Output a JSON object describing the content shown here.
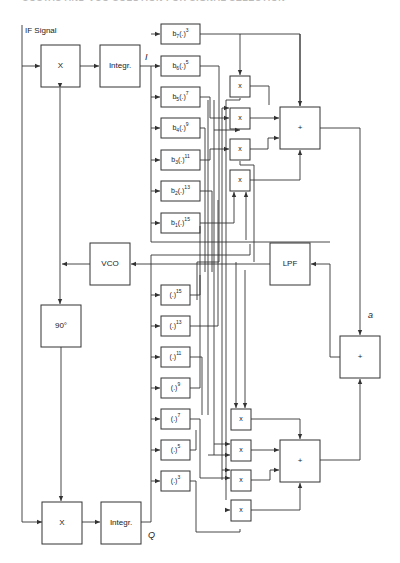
{
  "header": {
    "title": "COSTAS AND VCO SOLUTION FOR SIGNAL SELECTION"
  },
  "diagram": {
    "input_label": "IF Signal",
    "i_branch": {
      "mixer_label": "X",
      "integrator_label": "Integr.",
      "output_label": "I",
      "nonlinear_blocks": [
        {
          "coef": "b",
          "sub": "7",
          "exp": "3"
        },
        {
          "coef": "b",
          "sub": "6",
          "exp": "5"
        },
        {
          "coef": "b",
          "sub": "5",
          "exp": "7"
        },
        {
          "coef": "b",
          "sub": "4",
          "exp": "9"
        },
        {
          "coef": "b",
          "sub": "3",
          "exp": "11"
        },
        {
          "coef": "b",
          "sub": "2",
          "exp": "13"
        },
        {
          "coef": "b",
          "sub": "1",
          "exp": "15"
        }
      ],
      "multipliers": [
        "x",
        "x",
        "x",
        "x"
      ],
      "summer_label": "+"
    },
    "q_branch": {
      "mixer_label": "X",
      "integrator_label": "Integr.",
      "output_label": "Q",
      "power_blocks": [
        {
          "exp": "15"
        },
        {
          "exp": "13"
        },
        {
          "exp": "11"
        },
        {
          "exp": "9"
        },
        {
          "exp": "7"
        },
        {
          "exp": "5"
        },
        {
          "exp": "3"
        }
      ],
      "multipliers": [
        "x",
        "x",
        "x",
        "x"
      ],
      "summer_label": "+"
    },
    "vco_label": "VCO",
    "lpf_label": "LPF",
    "phase_shift_label": "90°",
    "final_summer_label": "+",
    "error_signal_label": "a",
    "arg_placeholder": "(.)"
  }
}
